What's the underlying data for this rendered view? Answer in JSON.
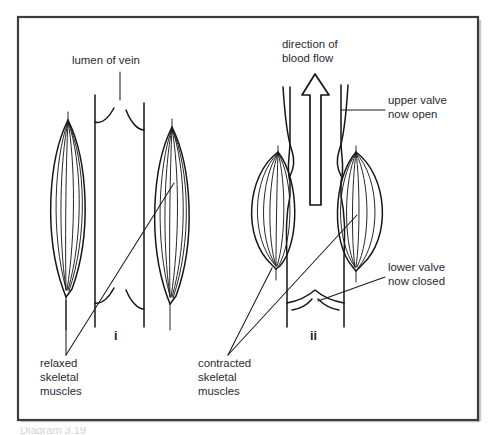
{
  "figure": {
    "title_visible": false,
    "frame": {
      "x": 18,
      "y": 17,
      "width": 460,
      "height": 403,
      "border_color": "#3b3b40",
      "background": "#ffffff"
    },
    "ink_color": "#15151a",
    "text_color": "#2a2a2e"
  },
  "labels": {
    "lumen_of_vein": "lumen of vein",
    "direction_of_blood_flow_line1": "direction of",
    "direction_of_blood_flow_line2": "blood flow",
    "upper_valve_line1": "upper valve",
    "upper_valve_line2": "now open",
    "lower_valve_line1": "lower valve",
    "lower_valve_line2": "now closed",
    "relaxed_line1": "relaxed",
    "relaxed_line2": "skeletal",
    "relaxed_line3": "muscles",
    "contracted_line1": "contracted",
    "contracted_line2": "skeletal",
    "contracted_line3": "muscles"
  },
  "panels": [
    {
      "id": "i",
      "number_label": "i",
      "state": "relaxed",
      "description": "Vein with straight parallel walls; skeletal muscles relaxed and elongated; both valves hang loose"
    },
    {
      "id": "ii",
      "number_label": "ii",
      "state": "contracted",
      "description": "Vein compressed by contracted bulging skeletal muscles; upper valve open, lower valve closed; blood forced upward"
    }
  ],
  "caption_sliver": "Diagram 3.19"
}
